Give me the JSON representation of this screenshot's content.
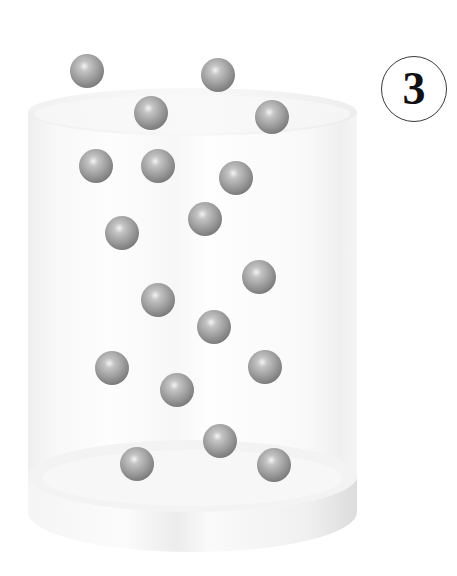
{
  "figure": {
    "label": "3",
    "colors": {
      "background": "#ffffff",
      "container_fill": "#f4f4f4",
      "container_edge": "#e6e6e6",
      "particle_base": "#9a9a9a",
      "particle_highlight": "#f2f2f2",
      "particle_shadow": "#7c7c7c",
      "label_text": "#111111",
      "label_ring": "#3a3a3a"
    },
    "container": {
      "left": 28,
      "right": 357,
      "top_ellipse_cy": 112,
      "top_ellipse_ry": 24,
      "base_top_cy": 476,
      "base_ry": 36,
      "base_thickness": 40
    },
    "particle_radius": 17,
    "particle_count": 20,
    "particles": [
      {
        "x": 87,
        "y": 71
      },
      {
        "x": 218,
        "y": 75
      },
      {
        "x": 151,
        "y": 113
      },
      {
        "x": 272,
        "y": 117
      },
      {
        "x": 96,
        "y": 166
      },
      {
        "x": 158,
        "y": 166
      },
      {
        "x": 236,
        "y": 178
      },
      {
        "x": 205,
        "y": 219
      },
      {
        "x": 122,
        "y": 233
      },
      {
        "x": 259,
        "y": 277
      },
      {
        "x": 158,
        "y": 300
      },
      {
        "x": 214,
        "y": 327
      },
      {
        "x": 112,
        "y": 368
      },
      {
        "x": 265,
        "y": 367
      },
      {
        "x": 177,
        "y": 390
      },
      {
        "x": 220,
        "y": 441
      },
      {
        "x": 137,
        "y": 464
      },
      {
        "x": 274,
        "y": 465
      }
    ]
  }
}
